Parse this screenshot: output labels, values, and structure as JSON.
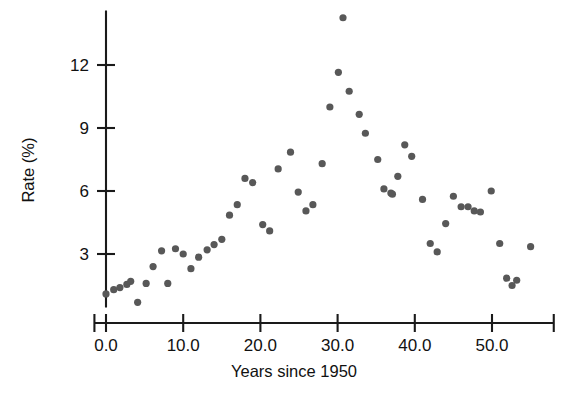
{
  "chart_data": {
    "type": "scatter",
    "title": "",
    "xlabel": "Years since 1950",
    "ylabel": "Rate (%)",
    "xticks": [
      0.0,
      10.0,
      20.0,
      30.0,
      40.0,
      50.0
    ],
    "xticklabels": [
      "0.0",
      "10.0",
      "20.0",
      "30.0",
      "40.0",
      "50.0"
    ],
    "yticks": [
      3,
      6,
      9,
      12
    ],
    "yticklabels": [
      "3",
      "6",
      "9",
      "12"
    ],
    "xlim": [
      -1.5,
      58.0
    ],
    "ylim": [
      0.0,
      14.6
    ],
    "grid": false,
    "legend": null,
    "marker_color": "#585858",
    "axis_color": "#1a1a1a",
    "series": [
      {
        "name": "Rate",
        "points": [
          {
            "x": 0.0,
            "y": 1.1
          },
          {
            "x": 1.0,
            "y": 1.3
          },
          {
            "x": 1.8,
            "y": 1.4
          },
          {
            "x": 2.7,
            "y": 1.55
          },
          {
            "x": 3.2,
            "y": 1.7
          },
          {
            "x": 4.1,
            "y": 0.7
          },
          {
            "x": 5.2,
            "y": 1.6
          },
          {
            "x": 6.1,
            "y": 2.4
          },
          {
            "x": 7.2,
            "y": 3.15
          },
          {
            "x": 8.0,
            "y": 1.6
          },
          {
            "x": 9.0,
            "y": 3.25
          },
          {
            "x": 10.0,
            "y": 3.0
          },
          {
            "x": 11.0,
            "y": 2.3
          },
          {
            "x": 12.0,
            "y": 2.85
          },
          {
            "x": 13.1,
            "y": 3.2
          },
          {
            "x": 14.0,
            "y": 3.45
          },
          {
            "x": 15.0,
            "y": 3.7
          },
          {
            "x": 16.0,
            "y": 4.85
          },
          {
            "x": 17.0,
            "y": 5.35
          },
          {
            "x": 18.0,
            "y": 6.6
          },
          {
            "x": 19.0,
            "y": 6.4
          },
          {
            "x": 20.3,
            "y": 4.4
          },
          {
            "x": 21.2,
            "y": 4.1
          },
          {
            "x": 22.3,
            "y": 7.05
          },
          {
            "x": 23.9,
            "y": 7.85
          },
          {
            "x": 24.9,
            "y": 5.95
          },
          {
            "x": 25.9,
            "y": 5.05
          },
          {
            "x": 26.8,
            "y": 5.35
          },
          {
            "x": 28.0,
            "y": 7.3
          },
          {
            "x": 29.0,
            "y": 10.0
          },
          {
            "x": 30.1,
            "y": 11.65
          },
          {
            "x": 30.7,
            "y": 14.25
          },
          {
            "x": 31.5,
            "y": 10.75
          },
          {
            "x": 32.8,
            "y": 9.65
          },
          {
            "x": 33.6,
            "y": 8.75
          },
          {
            "x": 35.2,
            "y": 7.5
          },
          {
            "x": 36.0,
            "y": 6.1
          },
          {
            "x": 36.9,
            "y": 5.9
          },
          {
            "x": 37.1,
            "y": 5.85
          },
          {
            "x": 37.8,
            "y": 6.7
          },
          {
            "x": 38.7,
            "y": 8.2
          },
          {
            "x": 39.6,
            "y": 7.65
          },
          {
            "x": 41.0,
            "y": 5.6
          },
          {
            "x": 42.0,
            "y": 3.5
          },
          {
            "x": 42.9,
            "y": 3.1
          },
          {
            "x": 44.0,
            "y": 4.45
          },
          {
            "x": 45.0,
            "y": 5.75
          },
          {
            "x": 46.0,
            "y": 5.25
          },
          {
            "x": 46.9,
            "y": 5.25
          },
          {
            "x": 47.7,
            "y": 5.05
          },
          {
            "x": 48.5,
            "y": 5.0
          },
          {
            "x": 49.9,
            "y": 6.0
          },
          {
            "x": 51.0,
            "y": 3.5
          },
          {
            "x": 51.9,
            "y": 1.85
          },
          {
            "x": 52.6,
            "y": 1.5
          },
          {
            "x": 53.2,
            "y": 1.75
          },
          {
            "x": 55.0,
            "y": 3.35
          }
        ]
      }
    ]
  }
}
